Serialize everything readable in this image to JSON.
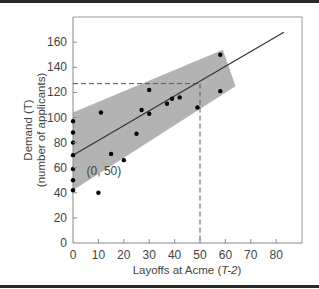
{
  "chart_data": {
    "type": "scatter",
    "title": "",
    "xlabel": "Layoffs at Acme (T-2)",
    "xlabel_parts": {
      "prefix": "Layoffs at Acme (",
      "italic": "T-2",
      "suffix": ")"
    },
    "ylabel_line1": "Demand (T)",
    "ylabel_line2": "(number of applicants)",
    "xlim": [
      0,
      90
    ],
    "ylim": [
      0,
      180
    ],
    "x_ticks": [
      0,
      10,
      20,
      30,
      40,
      50,
      60,
      70,
      80
    ],
    "y_ticks": [
      0,
      20,
      40,
      60,
      80,
      100,
      120,
      140,
      160
    ],
    "grid": false,
    "series": [
      {
        "name": "observations",
        "points": [
          [
            0,
            97
          ],
          [
            0,
            88
          ],
          [
            0,
            80
          ],
          [
            0,
            70
          ],
          [
            0,
            59
          ],
          [
            0,
            50
          ],
          [
            0,
            42
          ],
          [
            10,
            40
          ],
          [
            11,
            104
          ],
          [
            15,
            71
          ],
          [
            20,
            66
          ],
          [
            25,
            87
          ],
          [
            27,
            106
          ],
          [
            30,
            103
          ],
          [
            30,
            122
          ],
          [
            37,
            111
          ],
          [
            39,
            115
          ],
          [
            42,
            116
          ],
          [
            49,
            108
          ],
          [
            58,
            150
          ],
          [
            58,
            121
          ]
        ]
      }
    ],
    "regression_line": {
      "x0": 0,
      "y0": 70,
      "x1": 83,
      "y1": 168
    },
    "confidence_band": {
      "polygon": [
        [
          0,
          104
        ],
        [
          59,
          154
        ],
        [
          64,
          125
        ],
        [
          0,
          42
        ]
      ]
    },
    "forecast": {
      "x": 50,
      "y": 127
    },
    "annotations": [
      {
        "text": "(0, 50)",
        "x": 3,
        "y": 50
      }
    ]
  }
}
